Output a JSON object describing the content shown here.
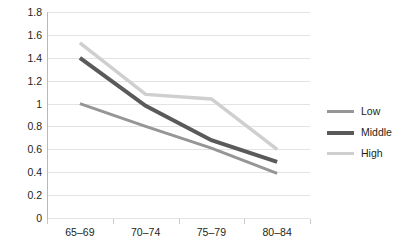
{
  "chart_data": {
    "type": "line",
    "title": "",
    "xlabel": "",
    "ylabel": "",
    "categories": [
      "65–69",
      "70–74",
      "75–79",
      "80–84"
    ],
    "ylim": [
      0,
      1.8
    ],
    "ytick_step": 0.2,
    "ytick_labels": [
      "0",
      "0.2",
      "0.4",
      "0.6",
      "0.8",
      "1",
      "1.2",
      "1.4",
      "1.6",
      "1.8"
    ],
    "grid": "horizontal",
    "legend_position": "right",
    "series": [
      {
        "name": "Low",
        "values": [
          1.0,
          0.8,
          0.61,
          0.39
        ],
        "color": "#969696",
        "width": 3
      },
      {
        "name": "Middle",
        "values": [
          1.4,
          0.98,
          0.68,
          0.49
        ],
        "color": "#5a5a5a",
        "width": 4
      },
      {
        "name": "High",
        "values": [
          1.53,
          1.08,
          1.04,
          0.6
        ],
        "color": "#cfcfcf",
        "width": 3.5
      }
    ]
  },
  "legend": {
    "items": [
      {
        "label": "Low",
        "color": "#969696"
      },
      {
        "label": "Middle",
        "color": "#5a5a5a"
      },
      {
        "label": "High",
        "color": "#cfcfcf"
      }
    ]
  },
  "colors": {
    "gridline": "#e3e3e3",
    "axis": "#b9b9b9",
    "text": "#231f20",
    "background": "#ffffff"
  }
}
